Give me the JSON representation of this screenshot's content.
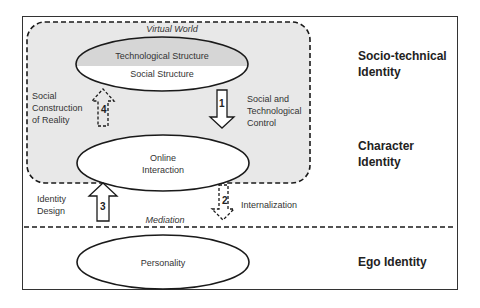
{
  "regions": {
    "virtual_world": "Virtual World",
    "mediation": "Mediation"
  },
  "nodes": {
    "technological_structure": "Technological Structure",
    "social_structure": "Social Structure",
    "online_interaction": "Online\nInteraction",
    "personality": "Personality"
  },
  "arrows": [
    {
      "number": "1",
      "label": "Social and\nTechnological\nControl",
      "style": "solid",
      "direction": "down"
    },
    {
      "number": "2",
      "label": "Internalization",
      "style": "dashed",
      "direction": "down"
    },
    {
      "number": "3",
      "label": "Identity\nDesign",
      "style": "solid",
      "direction": "up"
    },
    {
      "number": "4",
      "label": "Social\nConstruction\nof Reality",
      "style": "dashed",
      "direction": "up"
    }
  ],
  "identity_levels": [
    {
      "label": "Socio-technical\nIdentity"
    },
    {
      "label": "Character\nIdentity"
    },
    {
      "label": "Ego Identity"
    }
  ],
  "colors": {
    "virtual_world_fill": "#e6e6e6",
    "tech_structure_fill": "#d9d9d9",
    "stroke": "#1a1a1a"
  }
}
